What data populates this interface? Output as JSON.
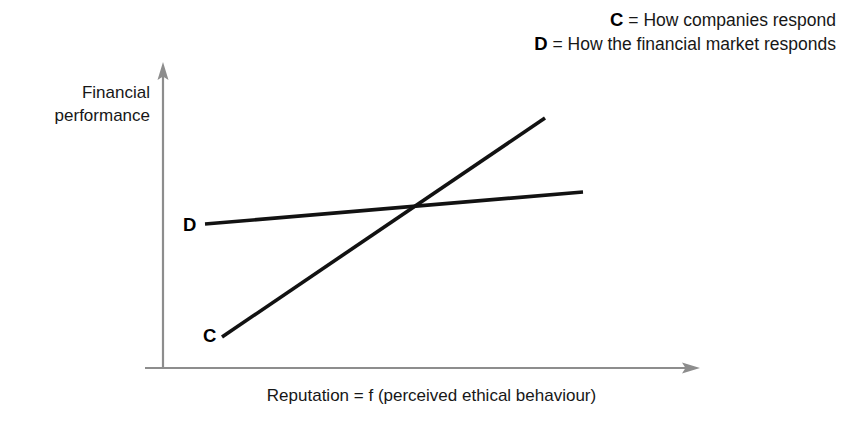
{
  "figure": {
    "width": 862,
    "height": 430,
    "background": "#ffffff"
  },
  "legend": {
    "position": "top-right",
    "entries": [
      {
        "key": "C",
        "separator": " = ",
        "text": "How companies respond"
      },
      {
        "key": "D",
        "separator": " = ",
        "text": "How the financial market responds"
      }
    ]
  },
  "axes": {
    "ylabel_line1": "Financial",
    "ylabel_line2": "performance",
    "xlabel": "Reputation = f (perceived ethical behaviour)",
    "axis_color": "#8d8d8d",
    "origin": {
      "x": 163,
      "y": 368
    },
    "y_arrow_tip": {
      "x": 163,
      "y": 62
    },
    "x_arrow_tip": {
      "x": 700,
      "y": 368
    },
    "x_left_overhang": 18
  },
  "curve_labels": {
    "c": "C",
    "d": "D"
  },
  "chart_data": {
    "type": "line",
    "title": "",
    "xlabel": "Reputation = f (perceived ethical behaviour)",
    "ylabel": "Financial performance",
    "grid": false,
    "legend_position": "top-right",
    "axis_ticks": {
      "x": [],
      "y": []
    },
    "xlim": [
      0,
      100
    ],
    "ylim": [
      0,
      100
    ],
    "line_color": "#121212",
    "series": [
      {
        "name": "C",
        "label": "How companies respond",
        "description": "Steeply rising line: financial performance increases strongly with reputation",
        "x": [
          11,
          71
        ],
        "y": [
          10,
          82
        ],
        "pixel_start": {
          "x": 222,
          "y": 337
        },
        "pixel_end": {
          "x": 545,
          "y": 118
        }
      },
      {
        "name": "D",
        "label": "How the financial market responds",
        "description": "Gently rising line: financial performance increases only slightly with reputation",
        "x": [
          8,
          78
        ],
        "y": [
          47,
          58
        ],
        "pixel_start": {
          "x": 205,
          "y": 224
        },
        "pixel_end": {
          "x": 583,
          "y": 192
        }
      }
    ],
    "annotations": [
      {
        "text": "C",
        "x": 8,
        "y": 10,
        "bold": true
      },
      {
        "text": "D",
        "x": 5,
        "y": 47,
        "bold": true
      }
    ],
    "intersection": {
      "x": 47,
      "y": 53,
      "pixel": {
        "x": 415,
        "y": 208
      }
    }
  }
}
